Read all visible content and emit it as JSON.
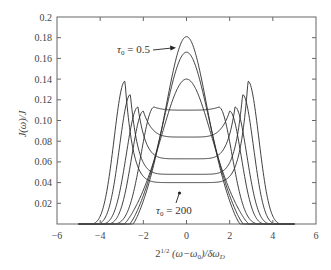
{
  "chart_data": {
    "type": "line",
    "title": "",
    "xlabel": "2^{1/2} (ω−ω₀)/δω_D",
    "ylabel": "J(ω)/J",
    "xlim": [
      -6,
      6
    ],
    "ylim": [
      0,
      0.2
    ],
    "x_ticks": [
      -6,
      -4,
      -2,
      0,
      2,
      4,
      6
    ],
    "x_tick_labels": [
      "−6",
      "−4",
      "−2",
      "0",
      "2",
      "4",
      "6"
    ],
    "y_ticks": [
      0.02,
      0.04,
      0.06,
      0.08,
      0.1,
      0.12,
      0.14,
      0.16,
      0.18,
      0.2
    ],
    "y_tick_labels": [
      "0.02",
      "0.04",
      "0.06",
      "0.08",
      "0.10",
      "0.12",
      "0.14",
      "0.16",
      "0.18",
      "0.2"
    ],
    "grid": false,
    "legend": null,
    "annotations": [
      {
        "text": "τ₀ = 0.5",
        "points_to": "tallest central peak (≈0.18 at x=0)"
      },
      {
        "text": "τ₀ = 200",
        "points_to": "flattest profile (≈0.04 at x=0)"
      }
    ],
    "series": [
      {
        "name": "τ0 = 0.5",
        "center": 0.181,
        "side_peak": null,
        "side_peak_x": null,
        "half_width": 2.05
      },
      {
        "name": "curve 2",
        "center": 0.166,
        "side_peak": null,
        "side_peak_x": null,
        "half_width": 2.2
      },
      {
        "name": "curve 3",
        "center": 0.14,
        "side_peak": null,
        "side_peak_x": null,
        "half_width": 2.45
      },
      {
        "name": "curve 4",
        "center": 0.11,
        "side_peak": 0.113,
        "side_peak_x": 1.5,
        "half_width": 2.75
      },
      {
        "name": "curve 5",
        "center": 0.084,
        "side_peak": 0.109,
        "side_peak_x": 2.0,
        "half_width": 3.05
      },
      {
        "name": "curve 6",
        "center": 0.063,
        "side_peak": 0.113,
        "side_peak_x": 2.25,
        "half_width": 3.3
      },
      {
        "name": "curve 7",
        "center": 0.048,
        "side_peak": 0.125,
        "side_peak_x": 2.6,
        "half_width": 3.55
      },
      {
        "name": "τ0 = 200",
        "center": 0.04,
        "side_peak": 0.138,
        "side_peak_x": 2.85,
        "half_width": 3.8
      }
    ]
  },
  "labels": {
    "ylabel": "J(ω)/J",
    "xlabel_base": "2",
    "xlabel_sup": "1/2",
    "xlabel_rest": " (ω−ω",
    "xlabel_sub0": "0",
    "xlabel_tail": ")/δω",
    "xlabel_subD": "D",
    "annot_top": "τ",
    "annot_top_sub": "0",
    "annot_top_val": " = 0.5",
    "annot_bottom": "τ",
    "annot_bottom_sub": "0",
    "annot_bottom_val": " = 200"
  }
}
